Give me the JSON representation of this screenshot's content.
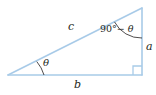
{
  "figure": {
    "name": "right-triangle-diagram",
    "type": "geometry-diagram",
    "background_color": "#ffffff",
    "line_color": "#a8cbe8",
    "arc_color": "#231f20",
    "text_color": "#231f20",
    "labels": {
      "hypotenuse": "c",
      "vertical_leg": "a",
      "horizontal_leg": "b",
      "base_angle": "θ",
      "apex_angle_prefix": "90",
      "apex_angle_degree": "°",
      "apex_angle_rest": "− θ",
      "apex_angle_full": "90° − θ"
    },
    "geometry": {
      "vertex_left": [
        8,
        75
      ],
      "vertex_bottom_right": [
        142,
        75
      ],
      "vertex_top_right": [
        142,
        8
      ],
      "right_angle_marker": "bottom-right",
      "base_angle_arc": "at left vertex",
      "apex_angle_arc": "at top-right vertex"
    }
  }
}
